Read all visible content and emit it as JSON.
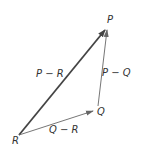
{
  "diagram": {
    "title": "",
    "points": {
      "P": {
        "label": "P",
        "x": 107,
        "y": 28
      },
      "Q": {
        "label": "Q",
        "x": 93,
        "y": 108
      },
      "R": {
        "label": "R",
        "x": 19,
        "y": 135
      }
    },
    "vectors": [
      {
        "from": "R",
        "to": "P",
        "label": "P − R",
        "weight": "bold"
      },
      {
        "from": "Q",
        "to": "P",
        "label": "P − Q",
        "weight": "thin"
      },
      {
        "from": "R",
        "to": "Q",
        "label": "Q − R",
        "weight": "thin"
      }
    ],
    "labels": {
      "P": "P",
      "Q": "Q",
      "R": "R",
      "p_minus_r": "P − R",
      "p_minus_q": "P − Q",
      "q_minus_r": "Q − R"
    },
    "colors": {
      "bold_vector": "#444444",
      "thin_vector": "#666666",
      "text": "#333333"
    }
  }
}
